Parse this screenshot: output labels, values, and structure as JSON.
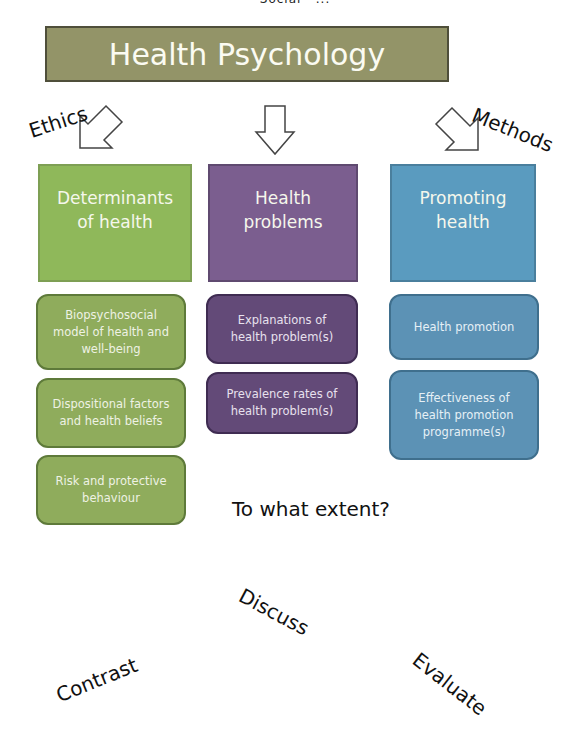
{
  "partial_top_text": "Social · ...",
  "header": {
    "title": "Health Psychology",
    "color": "#939468"
  },
  "side_labels": {
    "left": "Ethics",
    "right": "Methods"
  },
  "columns": [
    {
      "title": "Determinants of health",
      "title_lines": [
        "Determinants",
        "of health"
      ],
      "color": "#8fb85a",
      "items": [
        {
          "lines": [
            "Biopsychosocial",
            "model of health and",
            "well-being"
          ]
        },
        {
          "lines": [
            "Dispositional factors",
            "and health beliefs"
          ]
        },
        {
          "lines": [
            "Risk and protective",
            "behaviour"
          ]
        }
      ]
    },
    {
      "title": "Health problems",
      "title_lines": [
        "Health",
        "problems"
      ],
      "color": "#7b5e8f",
      "items": [
        {
          "lines": [
            "Explanations of",
            "health problem(s)"
          ]
        },
        {
          "lines": [
            "Prevalence rates of",
            "health problem(s)"
          ]
        }
      ]
    },
    {
      "title": "Promoting health",
      "title_lines": [
        "Promoting",
        "health"
      ],
      "color": "#5a9bbf",
      "items": [
        {
          "lines": [
            "Health promotion"
          ]
        },
        {
          "lines": [
            "Effectiveness of",
            "health promotion",
            "programme(s)"
          ]
        }
      ]
    }
  ],
  "command_terms": {
    "question": "To what extent?",
    "discuss": "Discuss",
    "contrast": "Contrast",
    "evaluate": "Evaluate"
  }
}
